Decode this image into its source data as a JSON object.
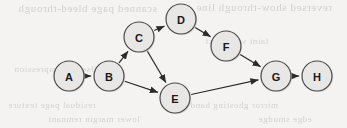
{
  "figure": {
    "kind": "directed-acyclic-graph",
    "width": 347,
    "height": 128,
    "background_color": "#f4f3f1",
    "node_fill_color": "#e8e7e5",
    "node_stroke_color": "#4a4a4a",
    "edge_color": "#2b2b2b",
    "label_color": "#1a1a1a",
    "node_radius": 15,
    "label_font_size": 11
  },
  "nodes": [
    {
      "id": "A",
      "label": "A",
      "x": 69,
      "y": 76
    },
    {
      "id": "B",
      "label": "B",
      "x": 109,
      "y": 76
    },
    {
      "id": "C",
      "label": "C",
      "x": 139,
      "y": 37
    },
    {
      "id": "D",
      "label": "D",
      "x": 181,
      "y": 19
    },
    {
      "id": "E",
      "label": "E",
      "x": 175,
      "y": 98
    },
    {
      "id": "F",
      "label": "F",
      "x": 226,
      "y": 46
    },
    {
      "id": "G",
      "label": "G",
      "x": 276,
      "y": 76
    },
    {
      "id": "H",
      "label": "H",
      "x": 317,
      "y": 76
    }
  ],
  "edges": [
    {
      "from": "A",
      "to": "B",
      "label": ""
    },
    {
      "from": "B",
      "to": "C",
      "label": ""
    },
    {
      "from": "B",
      "to": "E",
      "label": ""
    },
    {
      "from": "C",
      "to": "D",
      "label": ""
    },
    {
      "from": "C",
      "to": "E",
      "label": ""
    },
    {
      "from": "D",
      "to": "F",
      "label": ""
    },
    {
      "from": "E",
      "to": "G",
      "label": ""
    },
    {
      "from": "F",
      "to": "G",
      "label": ""
    },
    {
      "from": "G",
      "to": "H",
      "label": ""
    }
  ],
  "background_ghost_text": [
    {
      "text": "scanned page bleed-through",
      "x": 18,
      "y": 2,
      "size": 11
    },
    {
      "text": "reversed show-through line",
      "x": 196,
      "y": 1,
      "size": 11
    },
    {
      "text": "faint verso text",
      "x": 205,
      "y": 36,
      "size": 9
    },
    {
      "text": "offset ink impression",
      "x": 14,
      "y": 64,
      "size": 9
    },
    {
      "text": "residual page texture",
      "x": 8,
      "y": 100,
      "size": 9
    },
    {
      "text": "mirror ghosting band",
      "x": 190,
      "y": 100,
      "size": 9
    },
    {
      "text": "lower margin remnant",
      "x": 48,
      "y": 114,
      "size": 9
    },
    {
      "text": "edge smudge",
      "x": 258,
      "y": 114,
      "size": 9
    }
  ]
}
